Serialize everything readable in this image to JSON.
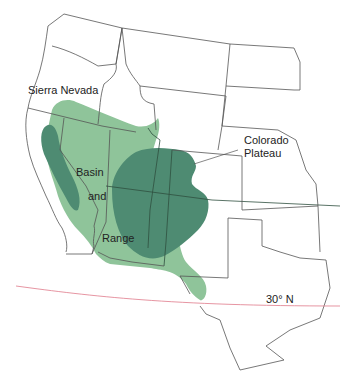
{
  "map": {
    "title": "Western United States physiographic regions",
    "colors": {
      "background": "#ffffff",
      "basin_and_range": "#8fc49a",
      "highland": "#4e8b72",
      "state_borders": "#555555",
      "latitude_line": "#e07a8a"
    },
    "labels": {
      "sierra_nevada": "Sierra Nevada",
      "basin": "Basin",
      "and": "and",
      "range": "Range",
      "colorado": "Colorado",
      "plateau": "Plateau",
      "latitude": "30° N"
    },
    "legend_regions": [
      {
        "name": "Basin and Range",
        "color": "#8fc49a"
      },
      {
        "name": "Sierra Nevada",
        "color": "#4e8b72"
      },
      {
        "name": "Colorado Plateau",
        "color": "#4e8b72"
      }
    ]
  }
}
